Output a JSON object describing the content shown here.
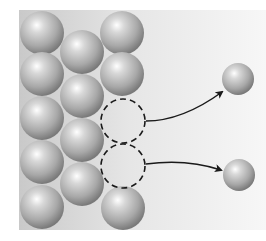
{
  "diagram": {
    "title": "",
    "background": {
      "x": 19,
      "y": 10,
      "width": 247,
      "height": 220,
      "color_left": "#c9c9c9",
      "color_right": "#f7f7f7"
    },
    "sphere_colors": {
      "highlight": "#ffffff",
      "mid": "#b8b8b8",
      "edge": "#7a7a7a"
    },
    "lattice_atoms": [
      {
        "cx": 42,
        "cy": 33,
        "r": 22
      },
      {
        "cx": 42,
        "cy": 74,
        "r": 22
      },
      {
        "cx": 42,
        "cy": 118,
        "r": 22
      },
      {
        "cx": 42,
        "cy": 162,
        "r": 22
      },
      {
        "cx": 42,
        "cy": 207,
        "r": 22
      },
      {
        "cx": 82,
        "cy": 52,
        "r": 22
      },
      {
        "cx": 82,
        "cy": 96,
        "r": 22
      },
      {
        "cx": 82,
        "cy": 140,
        "r": 22
      },
      {
        "cx": 82,
        "cy": 184,
        "r": 22
      },
      {
        "cx": 122,
        "cy": 33,
        "r": 22
      },
      {
        "cx": 122,
        "cy": 74,
        "r": 22
      },
      {
        "cx": 123,
        "cy": 208,
        "r": 22
      }
    ],
    "vacancies": [
      {
        "cx": 123,
        "cy": 121,
        "r": 22
      },
      {
        "cx": 123,
        "cy": 166,
        "r": 22
      }
    ],
    "ejected_atoms": [
      {
        "cx": 238,
        "cy": 79,
        "r": 16
      },
      {
        "cx": 239,
        "cy": 175,
        "r": 16
      }
    ],
    "arrows": [
      {
        "path": "M146,121 C175,121 200,108 222,92"
      },
      {
        "path": "M146,164 C175,160 200,163 221,170"
      }
    ],
    "labels": []
  }
}
